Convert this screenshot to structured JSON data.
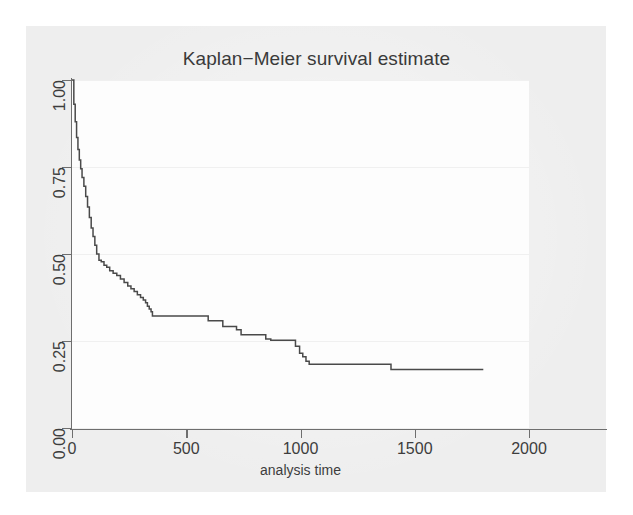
{
  "figure": {
    "background_color": "#eeeeee",
    "plot_background_color": "#fdfdfd",
    "line_color": "#4a4a4a",
    "axis_color": "#6e6e6e",
    "grid_color": "#f0f0f0"
  },
  "chart_data": {
    "type": "line",
    "title": "Kaplan−Meier survival estimate",
    "xlabel": "analysis time",
    "ylabel": "",
    "xlim": [
      0,
      2000
    ],
    "ylim": [
      0,
      1.0
    ],
    "xticks": [
      0,
      500,
      1000,
      1500,
      2000
    ],
    "xtick_labels": [
      "0",
      "500",
      "1000",
      "1500",
      "2000"
    ],
    "yticks": [
      0.0,
      0.25,
      0.5,
      0.75,
      1.0
    ],
    "ytick_labels": [
      "0.00",
      "0.25",
      "0.50",
      "0.75",
      "1.00"
    ],
    "grid": true,
    "legend": null,
    "step_style": "post",
    "series": [
      {
        "name": "survival",
        "x": [
          0,
          8,
          14,
          20,
          26,
          32,
          38,
          44,
          52,
          60,
          68,
          76,
          84,
          92,
          100,
          108,
          118,
          128,
          140,
          152,
          165,
          180,
          196,
          212,
          228,
          244,
          258,
          272,
          286,
          300,
          312,
          322,
          330,
          338,
          346,
          352,
          580,
          596,
          640,
          660,
          700,
          720,
          740,
          828,
          848,
          870,
          960,
          978,
          996,
          1010,
          1024,
          1038,
          1380,
          1396,
          1800
        ],
        "y": [
          1.0,
          0.93,
          0.88,
          0.835,
          0.8,
          0.77,
          0.745,
          0.72,
          0.695,
          0.665,
          0.635,
          0.605,
          0.575,
          0.55,
          0.525,
          0.5,
          0.482,
          0.478,
          0.468,
          0.462,
          0.452,
          0.445,
          0.438,
          0.428,
          0.418,
          0.408,
          0.4,
          0.392,
          0.383,
          0.375,
          0.368,
          0.36,
          0.35,
          0.342,
          0.334,
          0.322,
          0.322,
          0.308,
          0.308,
          0.292,
          0.292,
          0.282,
          0.268,
          0.268,
          0.256,
          0.252,
          0.252,
          0.235,
          0.215,
          0.205,
          0.192,
          0.183,
          0.183,
          0.168,
          0.168
        ]
      }
    ]
  }
}
